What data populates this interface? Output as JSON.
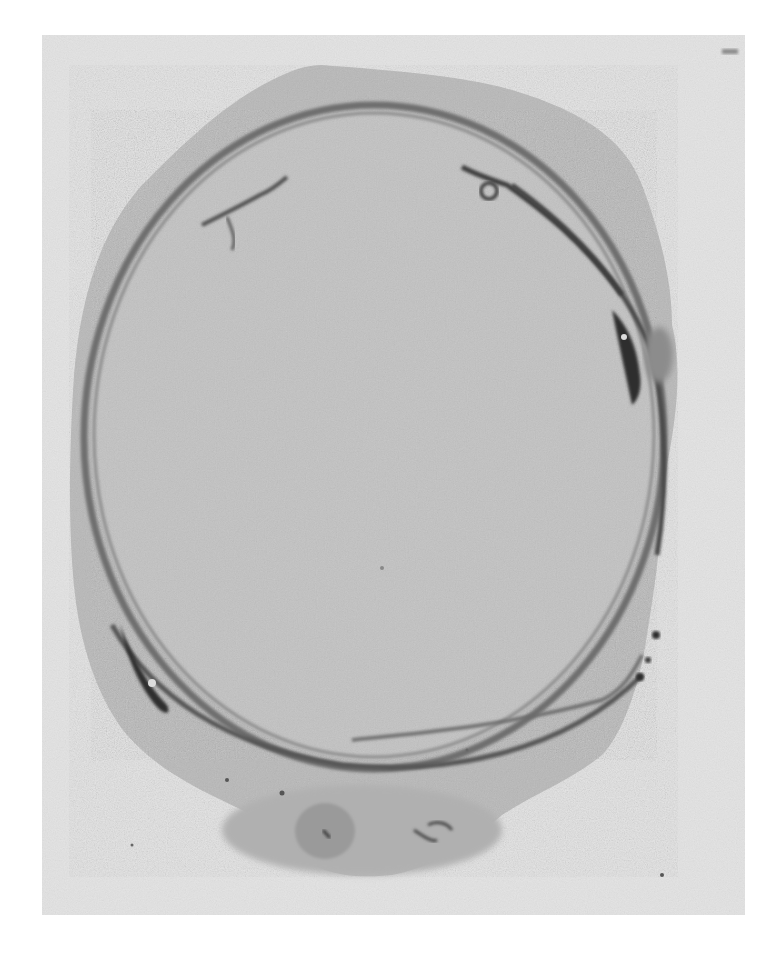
{
  "image": {
    "kind": "grayscale micrograph",
    "frame": {
      "x": 42,
      "y": 35,
      "width": 703,
      "height": 880
    },
    "colors": {
      "page_background": "#ffffff",
      "slide_background": "#e3e3e3",
      "outer_tissue": "#b8b8b8",
      "outer_tissue_light": "#c4c4c4",
      "inner_lumen": "#c2c2c2",
      "ring_wall": "#6e6e6e",
      "ring_wall_dark": "#3c3c3c",
      "dark_spots": "#2a2a2a",
      "bottom_nodule": "#9a9a9a"
    },
    "text_labels": []
  }
}
